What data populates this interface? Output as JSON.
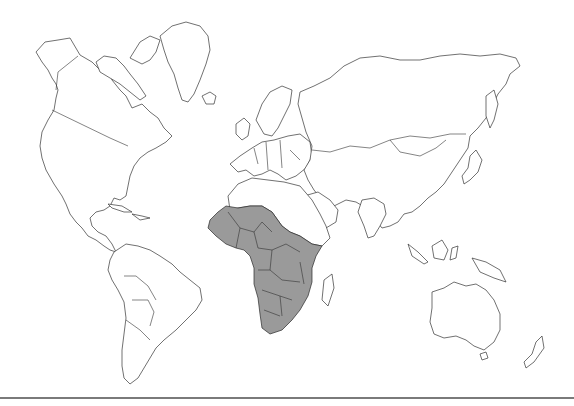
{
  "map": {
    "type": "world political outline map",
    "projection": "Miller-like cylindrical",
    "highlighted_region": "Sub-Saharan Africa",
    "colors": {
      "background": "#ffffff",
      "land_fill": "#ffffff",
      "outline": "#333333",
      "highlight_fill": "#9a9a9a",
      "separator": "#7a7a7a"
    },
    "regions": [
      {
        "name": "North America",
        "highlighted": false
      },
      {
        "name": "Greenland",
        "highlighted": false
      },
      {
        "name": "South America",
        "highlighted": false
      },
      {
        "name": "Europe",
        "highlighted": false
      },
      {
        "name": "North Africa",
        "highlighted": false
      },
      {
        "name": "Sub-Saharan Africa",
        "highlighted": true
      },
      {
        "name": "Madagascar",
        "highlighted": false
      },
      {
        "name": "Middle East",
        "highlighted": false
      },
      {
        "name": "Asia",
        "highlighted": false
      },
      {
        "name": "Australia",
        "highlighted": false
      },
      {
        "name": "New Zealand",
        "highlighted": false
      }
    ]
  }
}
